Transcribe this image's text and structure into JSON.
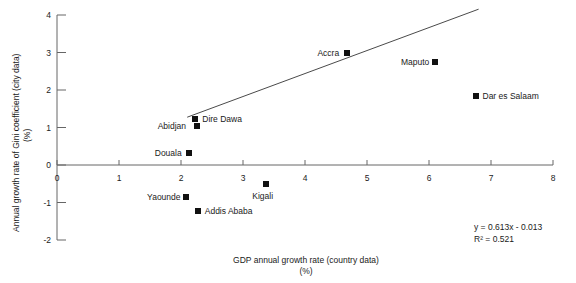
{
  "chart_data": {
    "type": "scatter",
    "title": "",
    "xlabel": "GDP annual growth rate (country data)",
    "xlabel_unit": "(%)",
    "ylabel": "Annual growth rate of Gini coefficient (city data)",
    "ylabel_unit": "(%)",
    "xlim": [
      0,
      8
    ],
    "ylim": [
      -2,
      4
    ],
    "xticks": [
      "0",
      "1",
      "2",
      "3",
      "4",
      "5",
      "6",
      "7",
      "8"
    ],
    "yticks": [
      "4",
      "3",
      "2",
      "1",
      "0",
      "-1",
      "-2"
    ],
    "grid": false,
    "legend": "none",
    "marker_color": "#111111",
    "line_color": "#4a4a4a",
    "points": [
      {
        "label": "Accra",
        "x": 4.68,
        "y": 3.0,
        "label_side": "left"
      },
      {
        "label": "Maputo",
        "x": 6.1,
        "y": 2.75,
        "label_side": "left"
      },
      {
        "label": "Dar es Salaam",
        "x": 6.75,
        "y": 1.85,
        "label_side": "right"
      },
      {
        "label": "Dire Dawa",
        "x": 2.23,
        "y": 1.22,
        "label_side": "right"
      },
      {
        "label": "Abidjan",
        "x": 2.25,
        "y": 1.05,
        "label_side": "left"
      },
      {
        "label": "Douala",
        "x": 2.13,
        "y": 0.32,
        "label_side": "left"
      },
      {
        "label": "Kigali",
        "x": 3.37,
        "y": -0.5,
        "label_side": "below"
      },
      {
        "label": "Yaounde",
        "x": 2.08,
        "y": -0.85,
        "label_side": "left"
      },
      {
        "label": "Addis Ababa",
        "x": 2.27,
        "y": -1.22,
        "label_side": "right"
      }
    ],
    "trendline": {
      "slope": 0.613,
      "intercept": -0.013,
      "x_start": 2.1,
      "x_end": 6.8,
      "equation": "y = 0.613x - 0.013",
      "r_squared": "R² = 0.521"
    }
  }
}
